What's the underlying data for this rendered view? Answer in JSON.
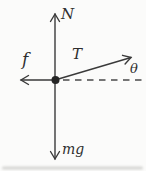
{
  "diagram": {
    "type": "free-body-diagram",
    "background_color": "#fbfbfa",
    "stroke_color": "#3a3a3a",
    "label_color": "#2e2e2e",
    "labels": {
      "normal_force": "N",
      "tension": "T",
      "friction": "f",
      "weight": "mg",
      "angle": "θ"
    }
  }
}
